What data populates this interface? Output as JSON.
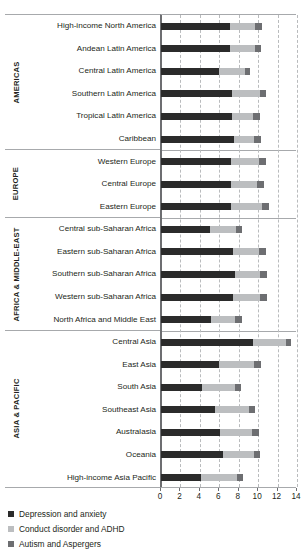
{
  "chart_data": {
    "type": "bar",
    "orientation": "horizontal",
    "stacked": true,
    "title": "",
    "xlabel": "",
    "ylabel": "",
    "xlim": [
      0,
      14
    ],
    "xticks": [
      0,
      2,
      4,
      6,
      8,
      10,
      12,
      14
    ],
    "xtick_labels": [
      "0",
      "2",
      "4",
      "6",
      "8",
      "10",
      "12",
      "14"
    ],
    "grid": "vertical-dashed",
    "legend_position": "below-left",
    "series": [
      {
        "name": "Depression and anxiety",
        "color": "#2b2b2b",
        "values": [
          7.1,
          7.1,
          6.0,
          7.3,
          7.3,
          7.5,
          7.2,
          7.2,
          7.2,
          5.0,
          7.4,
          7.6,
          7.4,
          5.1,
          9.5,
          6.0,
          4.2,
          5.6,
          6.1,
          6.4,
          4.1
        ]
      },
      {
        "name": "Conduct disorder and ADHD",
        "color": "#bcbec0",
        "values": [
          2.6,
          2.6,
          2.6,
          2.9,
          2.2,
          2.1,
          2.9,
          2.7,
          3.2,
          2.7,
          2.7,
          2.6,
          2.8,
          2.5,
          3.4,
          3.6,
          3.4,
          3.5,
          3.3,
          3.2,
          3.7
        ]
      },
      {
        "name": "Autism and Aspergers",
        "color": "#6d6e71",
        "values": [
          0.7,
          0.6,
          0.6,
          0.6,
          0.7,
          0.7,
          0.7,
          0.7,
          0.7,
          0.6,
          0.7,
          0.7,
          0.7,
          0.7,
          0.5,
          0.7,
          0.6,
          0.6,
          0.7,
          0.6,
          0.6
        ]
      }
    ],
    "groups": [
      {
        "name": "AMERICAS",
        "categories": [
          "High-income North America",
          "Andean Latin America",
          "Central Latin America",
          "Southern Latin America",
          "Tropical Latin America",
          "Caribbean"
        ]
      },
      {
        "name": "EUROPE",
        "categories": [
          "Western Europe",
          "Central Europe",
          "Eastern Europe"
        ]
      },
      {
        "name": "AFRICA & MIDDLE-EAST",
        "categories": [
          "Central sub-Saharan Africa",
          "Eastern sub-Saharan Africa",
          "Southern sub-Saharan Africa",
          "Western sub-Saharan Africa",
          "North Africa and Middle East"
        ]
      },
      {
        "name": "ASIA & PACIFIC",
        "categories": [
          "Central Asia",
          "East Asia",
          "South Asia",
          "Southeast Asia",
          "Australasia",
          "Oceania",
          "High-income Asia Pacific"
        ]
      }
    ],
    "legend": [
      {
        "label": "Depression and anxiety",
        "color": "#2b2b2b",
        "swatch": "dep"
      },
      {
        "label": "Conduct disorder and ADHD",
        "color": "#bcbec0",
        "swatch": "cond"
      },
      {
        "label": "Autism and Aspergers",
        "color": "#6d6e71",
        "swatch": "aut"
      }
    ]
  }
}
